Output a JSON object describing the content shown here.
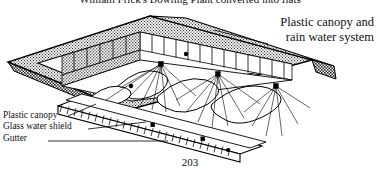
{
  "page": {
    "background_color": "#ffffff",
    "ink_color": "#000000",
    "page_number": "203"
  },
  "caption": {
    "text": "William Frick's Bowling Plant converted into flats"
  },
  "annotations": {
    "right": {
      "line1": "Plastic canopy and",
      "line2": "rain water system"
    },
    "left": [
      {
        "label": "Plastic canopy"
      },
      {
        "label": "Glass water shield"
      },
      {
        "label": "Gutter"
      }
    ]
  },
  "figure": {
    "type": "isometric-line-drawing",
    "roof_fill": "stipple",
    "elements": [
      "stippled roof slab",
      "interior partition walls",
      "tensile canopies on poles",
      "guy lines",
      "hatched gutter beam",
      "leader lines"
    ]
  }
}
